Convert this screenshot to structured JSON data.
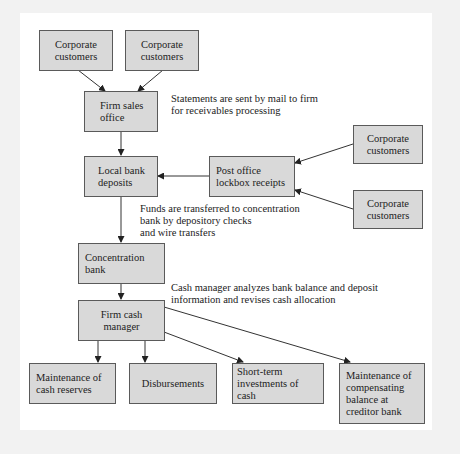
{
  "diagram": {
    "colors": {
      "background": "#f2f2f2",
      "panel": "#ffffff",
      "box_fill": "#d9d9d9",
      "box_border": "#5a5a5a",
      "arrow": "#222222"
    },
    "nodes": {
      "corp1": "Corporate\ncustomers",
      "corp2": "Corporate\ncustomers",
      "firm_sales": "Firm sales\noffice",
      "local_bank": "Local bank\ndeposits",
      "post_office": "Post office\nlockbox receipts",
      "corp3": "Corporate\ncustomers",
      "corp4": "Corporate\ncustomers",
      "concentration": "Concentration\nbank",
      "cash_manager": "Firm cash\nmanager",
      "cash_reserves": "Maintenance of\ncash reserves",
      "disbursements": "Disbursements",
      "short_term": "Short-term\ninvestments of cash",
      "compensating": "Maintenance of\ncompensating\nbalance at\ncreditor bank"
    },
    "notes": {
      "statements": "Statements are sent by mail to firm\nfor receivables processing",
      "funds": "Funds are transferred to concentration\nbank by depository checks\nand wire transfers",
      "cash_manager_note": "Cash manager analyzes bank balance and deposit\ninformation and revises cash allocation"
    },
    "edges": [
      {
        "from": "corp1",
        "to": "firm_sales"
      },
      {
        "from": "corp2",
        "to": "firm_sales"
      },
      {
        "from": "firm_sales",
        "to": "local_bank"
      },
      {
        "from": "post_office",
        "to": "local_bank"
      },
      {
        "from": "corp3",
        "to": "post_office"
      },
      {
        "from": "corp4",
        "to": "post_office"
      },
      {
        "from": "local_bank",
        "to": "concentration"
      },
      {
        "from": "concentration",
        "to": "cash_manager"
      },
      {
        "from": "cash_manager",
        "to": "cash_reserves"
      },
      {
        "from": "cash_manager",
        "to": "disbursements"
      },
      {
        "from": "cash_manager",
        "to": "short_term"
      },
      {
        "from": "cash_manager",
        "to": "compensating"
      }
    ]
  }
}
